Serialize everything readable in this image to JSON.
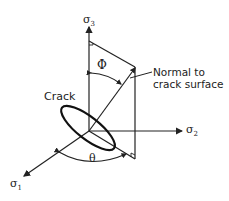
{
  "diagram": {
    "axes": {
      "sigma1": {
        "label": "σ",
        "sub": "1"
      },
      "sigma2": {
        "label": "σ",
        "sub": "2"
      },
      "sigma3": {
        "label": "σ",
        "sub": "3"
      }
    },
    "angles": {
      "phi": "Φ",
      "theta": "θ"
    },
    "labels": {
      "crack": "Crack",
      "normal_line1": "Normal to",
      "normal_line2": "crack surface"
    },
    "colors": {
      "stroke": "#222222",
      "background": "#ffffff"
    }
  }
}
